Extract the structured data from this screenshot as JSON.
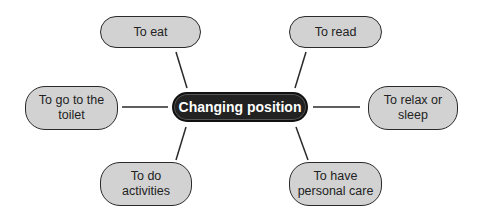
{
  "diagram": {
    "center": {
      "label": "Changing position"
    },
    "nodes": [
      {
        "id": "eat",
        "label": "To eat"
      },
      {
        "id": "read",
        "label": "To read"
      },
      {
        "id": "toilet",
        "label": "To go to the toilet"
      },
      {
        "id": "relax",
        "label": "To relax or sleep"
      },
      {
        "id": "activities",
        "label": "To do activities"
      },
      {
        "id": "personal-care",
        "label": "To have personal care"
      }
    ],
    "colors": {
      "node_fill": "#d2d2d2",
      "center_fill": "#222222",
      "line": "#2a2a2a"
    }
  }
}
